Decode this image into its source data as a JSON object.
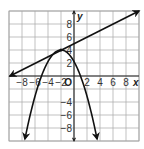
{
  "chart_data": {
    "type": "line",
    "title": "",
    "xlabel": "x",
    "ylabel": "y",
    "origin_label": "O",
    "xlim": [
      -10,
      10
    ],
    "ylim": [
      -10,
      10
    ],
    "grid": true,
    "grid_step": 2,
    "x_ticks": [
      "-8",
      "-6",
      "-4",
      "-2",
      "2",
      "4",
      "6",
      "8"
    ],
    "y_ticks": [
      "8",
      "6",
      "4",
      "2",
      "-4",
      "-6",
      "-8"
    ],
    "series": [
      {
        "name": "line",
        "equation": "y = 0.5x + 5",
        "points": [
          [
            -10,
            0
          ],
          [
            -2,
            4
          ],
          [
            0,
            5
          ],
          [
            10,
            10
          ]
        ],
        "arrows": "both"
      },
      {
        "name": "parabola",
        "equation": "y = -(4/9)(x + 5)(x - 1)",
        "vertex": [
          -2,
          4
        ],
        "x_intercepts": [
          -5,
          1
        ],
        "points": [
          [
            -7.6,
            -10
          ],
          [
            -5,
            0
          ],
          [
            -2,
            4
          ],
          [
            0,
            2.2
          ],
          [
            1,
            0
          ],
          [
            3.6,
            -10
          ]
        ],
        "arrows": "both ends downward"
      }
    ],
    "intersection": [
      -2,
      4
    ]
  }
}
